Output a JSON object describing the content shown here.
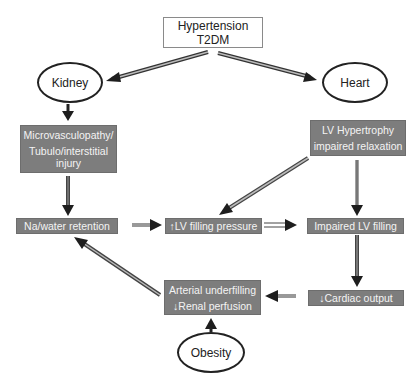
{
  "diagram": {
    "type": "flowchart",
    "colors": {
      "grey_box": "#7d7d7d",
      "grey_box_text": "#f4f4f4",
      "ellipse_border": "#222222",
      "arrow_dark": "#222222",
      "arrow_light": "#9a9a9a"
    },
    "nodes": {
      "root": {
        "lines": [
          "Hypertension",
          "T2DM"
        ]
      },
      "kidney": {
        "label": "Kidney"
      },
      "heart": {
        "label": "Heart"
      },
      "microvasculopathy": {
        "lines": [
          "Microvasculopathy/",
          "Tubulo/interstitial",
          "injury"
        ]
      },
      "lv_hypertrophy": {
        "lines": [
          "LV Hypertrophy",
          "impaired relaxation"
        ]
      },
      "na_water": {
        "label": "Na/water retention"
      },
      "lv_filling_pressure": {
        "label": "↑LV filling pressure"
      },
      "impaired_lv_filling": {
        "label": "Impaired LV filling"
      },
      "arterial_underfilling": {
        "lines": [
          "Arterial underfilling",
          "↓Renal perfusion"
        ]
      },
      "cardiac_output": {
        "label": "↓Cardiac output"
      },
      "obesity": {
        "label": "Obesity"
      }
    },
    "edges": [
      {
        "from": "Hypertension T2DM",
        "to": "Kidney",
        "style": "double"
      },
      {
        "from": "Hypertension T2DM",
        "to": "Heart",
        "style": "double"
      },
      {
        "from": "Kidney",
        "to": "Microvasculopathy/Tubulo/interstitial injury",
        "style": "solid"
      },
      {
        "from": "Microvasculopathy/Tubulo/interstitial injury",
        "to": "Na/water retention",
        "style": "solid"
      },
      {
        "from": "Na/water retention",
        "to": "↑LV filling pressure",
        "style": "light"
      },
      {
        "from": "Heart",
        "to": "LV Hypertrophy impaired relaxation",
        "style": "none"
      },
      {
        "from": "LV Hypertrophy impaired relaxation",
        "to": "↑LV filling pressure",
        "style": "double"
      },
      {
        "from": "LV Hypertrophy impaired relaxation",
        "to": "Impaired LV filling",
        "style": "double"
      },
      {
        "from": "↑LV filling pressure",
        "to": "Impaired LV filling",
        "style": "double"
      },
      {
        "from": "Impaired LV filling",
        "to": "↓Cardiac output",
        "style": "double"
      },
      {
        "from": "↓Cardiac output",
        "to": "Arterial underfilling ↓Renal perfusion",
        "style": "light"
      },
      {
        "from": "Arterial underfilling ↓Renal perfusion",
        "to": "Na/water retention",
        "style": "double"
      },
      {
        "from": "Obesity",
        "to": "Arterial underfilling ↓Renal perfusion",
        "style": "solid"
      }
    ]
  }
}
